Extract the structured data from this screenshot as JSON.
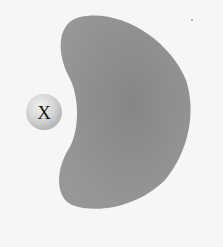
{
  "diagram": {
    "blob": {
      "shape": "bean",
      "color": "#8f8f8f",
      "description": "kidney-shaped region with concave left side"
    },
    "sphere": {
      "label": "X",
      "color": "#d0d0d0"
    },
    "background": "#f6f6f4"
  }
}
